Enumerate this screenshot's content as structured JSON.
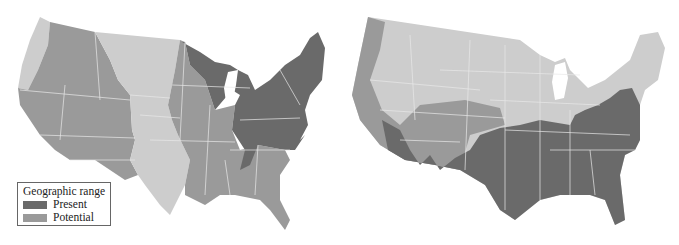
{
  "figure": {
    "panels": [
      {
        "id": "left",
        "description": "Contiguous United States map with eastern states in present range, central/western in potential range"
      },
      {
        "id": "right",
        "description": "Contiguous United States map with southern states in present range, southwest in potential range"
      }
    ]
  },
  "legend": {
    "title": "Geographic range",
    "items": [
      {
        "label": "Present",
        "color": "#6a6a6a"
      },
      {
        "label": "Potential",
        "color": "#9a9a9a"
      }
    ]
  },
  "colors": {
    "present": "#6a6a6a",
    "potential": "#9a9a9a",
    "outside": "#cdcdcd",
    "state_borders": "#e8e8e8"
  }
}
